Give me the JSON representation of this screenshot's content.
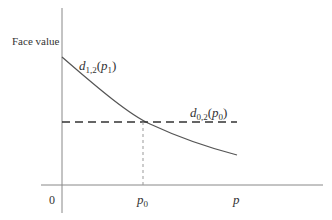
{
  "diagram": {
    "y_axis_label": "Face value",
    "origin_label": "0",
    "x_ticks": [
      {
        "label_base": "p",
        "label_sub": "0"
      },
      {
        "label_base": "p",
        "label_sub": ""
      }
    ],
    "curve_label": {
      "base": "d",
      "sub": "1,2",
      "arg_base": "p",
      "arg_sub": "1"
    },
    "dashed_line_label": {
      "base": "d",
      "sub": "0,2",
      "arg_base": "p",
      "arg_sub": "0"
    },
    "colors": {
      "axis": "#888888",
      "curve": "#555555",
      "dashed_horizontal": "#333333",
      "dashed_vertical": "#999999",
      "text": "#333333"
    }
  }
}
